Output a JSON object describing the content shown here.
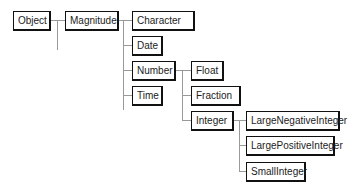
{
  "diagram": {
    "type": "class-hierarchy",
    "nodes": [
      {
        "id": "object",
        "label": "Object",
        "x": 13,
        "y": 11,
        "w": 38
      },
      {
        "id": "magnitude",
        "label": "Magnitude",
        "x": 65,
        "y": 11,
        "w": 54
      },
      {
        "id": "character",
        "label": "Character",
        "x": 132,
        "y": 11,
        "w": 63
      },
      {
        "id": "date",
        "label": "Date",
        "x": 132,
        "y": 36,
        "w": 31
      },
      {
        "id": "number",
        "label": "Number",
        "x": 132,
        "y": 61,
        "w": 44
      },
      {
        "id": "time",
        "label": "Time",
        "x": 132,
        "y": 86,
        "w": 31
      },
      {
        "id": "float",
        "label": "Float",
        "x": 191,
        "y": 61,
        "w": 33
      },
      {
        "id": "fraction",
        "label": "Fraction",
        "x": 191,
        "y": 86,
        "w": 50
      },
      {
        "id": "integer",
        "label": "Integer",
        "x": 191,
        "y": 111,
        "w": 43
      },
      {
        "id": "largenegativeinteger",
        "label": "LargeNegativeInteger",
        "x": 246,
        "y": 111,
        "w": 94
      },
      {
        "id": "largepositiveinteger",
        "label": "LargePositiveInteger",
        "x": 246,
        "y": 136,
        "w": 89
      },
      {
        "id": "smallinteger",
        "label": "SmallInteger",
        "x": 246,
        "y": 162,
        "w": 60
      }
    ],
    "edges": [
      {
        "from": "Object",
        "to": "Magnitude"
      },
      {
        "from": "Magnitude",
        "to": "Character"
      },
      {
        "from": "Magnitude",
        "to": "Date"
      },
      {
        "from": "Magnitude",
        "to": "Number"
      },
      {
        "from": "Magnitude",
        "to": "Time"
      },
      {
        "from": "Number",
        "to": "Float"
      },
      {
        "from": "Number",
        "to": "Fraction"
      },
      {
        "from": "Number",
        "to": "Integer"
      },
      {
        "from": "Integer",
        "to": "LargeNegativeInteger"
      },
      {
        "from": "Integer",
        "to": "LargePositiveInteger"
      },
      {
        "from": "Integer",
        "to": "SmallInteger"
      }
    ]
  }
}
